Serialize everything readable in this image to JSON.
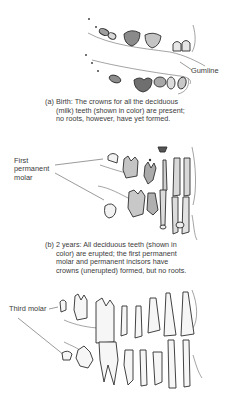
{
  "figure": {
    "panels": [
      {
        "id": "a",
        "tag": "(a)",
        "caption": "Birth: The crowns for all the deciduous (milk) teeth (shown in color) are present; no roots, however, have yet formed.",
        "labels": [
          {
            "text": "Gumline"
          }
        ]
      },
      {
        "id": "b",
        "tag": "(b)",
        "caption": "2 years: All deciduous teeth (shown in color) are erupted; the first permanent molar and permanent incisors have crowns (unerupted) formed, but no roots.",
        "labels": [
          {
            "text": "First permanent molar"
          }
        ]
      },
      {
        "id": "c",
        "labels": [
          {
            "text": "Third molar"
          }
        ]
      }
    ],
    "colors": {
      "background": "#ffffff",
      "deciduous_fill": "#bdbdbd",
      "outline": "#2e2e2e",
      "permanent_fill": "#f2f2f2",
      "text": "#3a3a3a"
    }
  }
}
